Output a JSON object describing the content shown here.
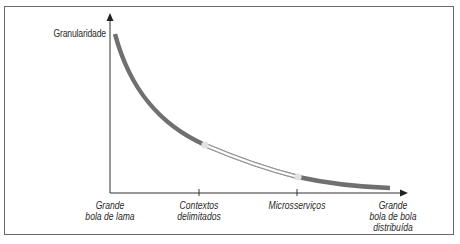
{
  "diagram": {
    "y_axis_label": "Granularidade",
    "x_axis_points": [
      {
        "label": "Grande\nbola de lama"
      },
      {
        "label": "Contextos\ndelimitados"
      },
      {
        "label": "Microsserviços"
      },
      {
        "label": "Grande\nbola de bola\ndistribuída"
      }
    ],
    "colors": {
      "curve": "#707070",
      "highlight_fill": "#ffffff",
      "highlight_edge": "#9a9a9a",
      "highlight_marker": "#e2e2e2",
      "axis": "#333333",
      "frame": "#6a6a6a"
    }
  }
}
